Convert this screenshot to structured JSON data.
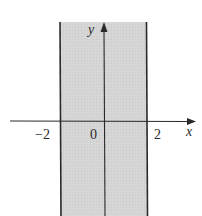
{
  "figure": {
    "region": {
      "inequality": "|x| < 2",
      "x_min": -2,
      "x_max": 2,
      "shade_color": "#d4d4d4",
      "boundary_color": "#2a2a2a"
    },
    "axes": {
      "x_label": "x",
      "y_label": "y",
      "tick_labels": [
        "−2",
        "0",
        "2"
      ]
    }
  }
}
